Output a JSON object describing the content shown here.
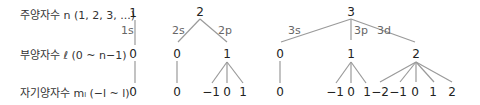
{
  "labels": {
    "principal": "주양자수 n (1, 2, 3, ...)",
    "azimuthal": "부양자수 ℓ (0 ~ n−1)",
    "magnetic": "자기양자수 mₗ (−l ~ l)"
  },
  "n_values": [
    "1",
    "2",
    "3"
  ],
  "orbitals": [
    "1s",
    "2s",
    "2p",
    "3s",
    "3p",
    "3d"
  ],
  "l_values": [
    "0",
    "0",
    "1",
    "0",
    "1",
    "2"
  ],
  "m_values": {
    "1s": [
      "0"
    ],
    "2s": [
      "0"
    ],
    "2p": [
      "−1",
      "0",
      "1"
    ],
    "3s": [
      "0"
    ],
    "3p": [
      "−1",
      "0",
      "1"
    ],
    "3d": [
      "−2",
      "−1",
      "0",
      "1",
      "2"
    ]
  }
}
